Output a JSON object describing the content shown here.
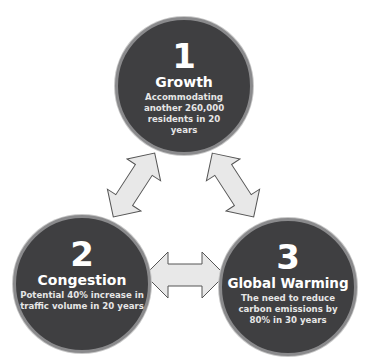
{
  "diagram": {
    "type": "cycle",
    "colors": {
      "circle_fill": "#3f3f41",
      "circle_border": "#8a8a8c",
      "arrow_fill": "#e8e8e8",
      "arrow_stroke": "#555555",
      "text": "#ffffff"
    },
    "nodes": [
      {
        "number": "1",
        "title": "Growth",
        "description": "Accommodating another 260,000 residents in 20 years"
      },
      {
        "number": "2",
        "title": "Congestion",
        "description": "Potential 40% increase in traffic volume in 20 years"
      },
      {
        "number": "3",
        "title": "Global Warming",
        "description": "The need to reduce carbon emissions by 80% in 30 years"
      }
    ],
    "connectors": [
      {
        "from": "1",
        "to": "2",
        "style": "double-arrow"
      },
      {
        "from": "1",
        "to": "3",
        "style": "double-arrow"
      },
      {
        "from": "2",
        "to": "3",
        "style": "double-arrow"
      }
    ]
  }
}
